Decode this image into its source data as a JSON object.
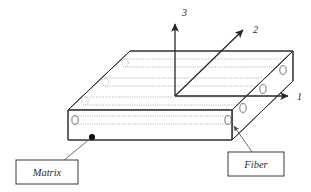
{
  "figure": {
    "background_color": "#ffffff",
    "line_color": "#303030",
    "fiber_color": "#9a9a9a"
  },
  "axes": [
    {
      "id": "axis-1",
      "label": "1",
      "direction": "horizontal-right",
      "label_x": 297,
      "label_y": 100
    },
    {
      "id": "axis-2",
      "label": "2",
      "direction": "diagonal-up-right",
      "label_x": 253,
      "label_y": 33
    },
    {
      "id": "axis-3",
      "label": "3",
      "direction": "vertical-up",
      "label_x": 182,
      "label_y": 16
    }
  ],
  "callouts": [
    {
      "id": "matrix",
      "label": "Matrix",
      "box_x": 16,
      "box_y": 160,
      "box_w": 62,
      "box_h": 24,
      "pointer_x": 92,
      "pointer_y": 137,
      "pointer_type": "dot"
    },
    {
      "id": "fiber",
      "label": "Fiber",
      "box_x": 228,
      "box_y": 152,
      "box_w": 56,
      "box_h": 24,
      "pointer_x": 233,
      "pointer_y": 125,
      "pointer_type": "arrow"
    }
  ],
  "block": {
    "description": "oblique projection rectangular slab",
    "front_left_top": [
      68,
      110
    ],
    "front_right_top": [
      232,
      110
    ],
    "front_left_bottom": [
      68,
      140
    ],
    "front_right_bottom": [
      232,
      140
    ],
    "back_left_top": [
      130,
      51
    ],
    "back_right_top": [
      293,
      51
    ],
    "fiber_rows_top": 3,
    "fiber_rows_front": 1
  }
}
